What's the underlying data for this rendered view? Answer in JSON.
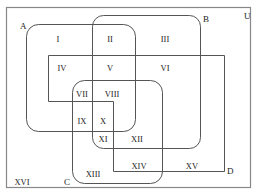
{
  "universe_label": "U",
  "sets": [
    {
      "id": "A",
      "label": "A"
    },
    {
      "id": "B",
      "label": "B"
    },
    {
      "id": "C",
      "label": "C"
    },
    {
      "id": "D",
      "label": "D"
    }
  ],
  "regions": [
    "I",
    "II",
    "III",
    "IV",
    "V",
    "VI",
    "VII",
    "VIII",
    "IX",
    "X",
    "XI",
    "XII",
    "XIII",
    "XIV",
    "XV",
    "XVI"
  ],
  "colors": {
    "stroke": "#555555",
    "universe_stroke": "#888888",
    "text": "#222222"
  }
}
